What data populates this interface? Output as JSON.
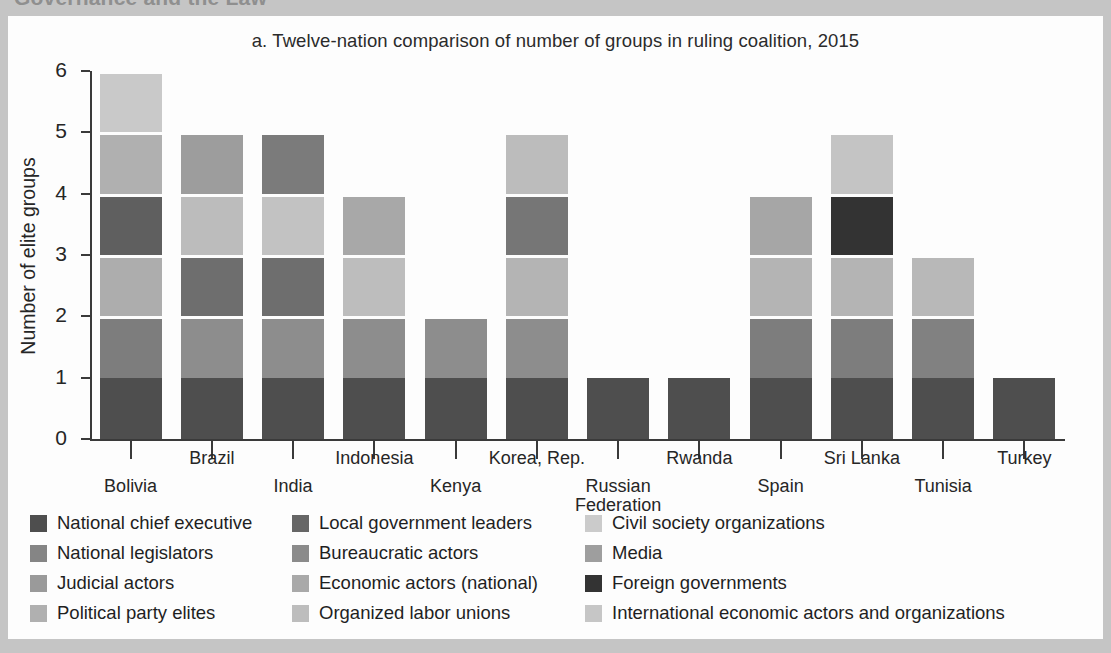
{
  "page": {
    "cut_off_heading": "Governance and the Law",
    "background_color": "#c5c5c5",
    "figure_background": "#fdfdfd"
  },
  "chart_data": {
    "type": "bar",
    "stacked": true,
    "title": "a. Twelve-nation comparison of number of groups in ruling coalition, 2015",
    "xlabel": "",
    "ylabel": "Number of elite groups",
    "ylim": [
      0,
      6
    ],
    "yticks": [
      0,
      1,
      2,
      3,
      4,
      5,
      6
    ],
    "ytick_labels": [
      "0",
      "1",
      "2",
      "3",
      "4",
      "5",
      "6"
    ],
    "grid": false,
    "legend_position": "bottom",
    "categories": [
      "Bolivia",
      "Brazil",
      "India",
      "Indonesia",
      "Kenya",
      "Korea, Rep.",
      "Russian\nFederation",
      "Rwanda",
      "Spain",
      "Sri Lanka",
      "Tunisia",
      "Turkey"
    ],
    "category_labels": [
      "Bolivia",
      "Brazil",
      "India",
      "Indonesia",
      "Kenya",
      "Korea, Rep.",
      "Russian Federation",
      "Rwanda",
      "Spain",
      "Sri Lanka",
      "Tunisia",
      "Turkey"
    ],
    "totals": [
      6,
      5,
      5,
      4,
      2,
      5,
      1,
      1,
      4,
      5,
      3,
      1
    ],
    "series": [
      {
        "name": "National chief executive",
        "color": "#4e4e4e",
        "values": [
          1,
          1,
          1,
          1,
          1,
          1,
          1,
          1,
          1,
          1,
          1,
          1
        ]
      },
      {
        "name": "National legislators",
        "color": "#7d7d7d",
        "values": [
          1,
          1,
          1,
          1,
          1,
          1,
          0,
          0,
          1,
          1,
          1,
          0
        ]
      },
      {
        "name": "Judicial actors",
        "color": "#939393",
        "values": [
          0,
          0,
          0,
          0,
          0,
          0,
          0,
          0,
          0,
          0,
          0,
          0
        ]
      },
      {
        "name": "Political party elites",
        "color": "#adadad",
        "values": [
          1,
          0,
          0,
          0,
          0,
          1,
          0,
          0,
          1,
          1,
          1,
          0
        ]
      },
      {
        "name": "Local government leaders",
        "color": "#6b6b6b",
        "values": [
          1,
          1,
          1,
          1,
          0,
          1,
          0,
          0,
          0,
          0,
          0,
          0
        ]
      },
      {
        "name": "Bureaucratic actors",
        "color": "#8a8a8a",
        "values": [
          0,
          0,
          0,
          0,
          0,
          0,
          0,
          0,
          0,
          0,
          0,
          0
        ]
      },
      {
        "name": "Economic actors (national)",
        "color": "#a8a8a8",
        "values": [
          0,
          1,
          0,
          1,
          0,
          0,
          0,
          0,
          1,
          0,
          0,
          0
        ]
      },
      {
        "name": "Organized labor unions",
        "color": "#b8b8b8",
        "values": [
          0,
          0,
          0,
          0,
          0,
          0,
          0,
          0,
          0,
          0,
          0,
          0
        ]
      },
      {
        "name": "Civil society organizations",
        "color": "#c9c9c9",
        "values": [
          1,
          0,
          0,
          0,
          0,
          0,
          0,
          0,
          0,
          1,
          0,
          0
        ]
      },
      {
        "name": "Media",
        "color": "#9d9d9d",
        "values": [
          0,
          1,
          1,
          0,
          0,
          0,
          0,
          0,
          0,
          0,
          0,
          0
        ]
      },
      {
        "name": "Foreign governments",
        "color": "#333333",
        "values": [
          0,
          0,
          0,
          0,
          0,
          0,
          0,
          0,
          0,
          1,
          0,
          0
        ]
      },
      {
        "name": "International economic actors and organizations",
        "color": "#c2c2c2",
        "values": [
          0,
          0,
          1,
          0,
          0,
          1,
          0,
          0,
          0,
          0,
          0,
          0
        ]
      }
    ],
    "stacks": [
      {
        "category": "Bolivia",
        "segments": [
          {
            "label": "National chief executive",
            "color": "#4e4e4e",
            "value": 1
          },
          {
            "label": "National legislators",
            "color": "#7d7d7d",
            "value": 1
          },
          {
            "label": "Political party elites",
            "color": "#adadad",
            "value": 1
          },
          {
            "label": "Local government leaders",
            "color": "#5f5f5f",
            "value": 1
          },
          {
            "label": "Media",
            "color": "#b0b0b0",
            "value": 1
          },
          {
            "label": "Civil society organizations",
            "color": "#c9c9c9",
            "value": 1
          }
        ]
      },
      {
        "category": "Brazil",
        "segments": [
          {
            "label": "National chief executive",
            "color": "#4e4e4e",
            "value": 1
          },
          {
            "label": "National legislators",
            "color": "#8d8d8d",
            "value": 1
          },
          {
            "label": "Local government leaders",
            "color": "#6e6e6e",
            "value": 1
          },
          {
            "label": "Economic actors (national)",
            "color": "#bcbcbc",
            "value": 1
          },
          {
            "label": "Media",
            "color": "#9d9d9d",
            "value": 1
          }
        ]
      },
      {
        "category": "India",
        "segments": [
          {
            "label": "National chief executive",
            "color": "#4e4e4e",
            "value": 1
          },
          {
            "label": "National legislators",
            "color": "#8d8d8d",
            "value": 1
          },
          {
            "label": "Local government leaders",
            "color": "#6e6e6e",
            "value": 1
          },
          {
            "label": "International economic actors and organizations",
            "color": "#c2c2c2",
            "value": 1
          },
          {
            "label": "Media",
            "color": "#7b7b7b",
            "value": 1
          }
        ]
      },
      {
        "category": "Indonesia",
        "segments": [
          {
            "label": "National chief executive",
            "color": "#4e4e4e",
            "value": 1
          },
          {
            "label": "National legislators",
            "color": "#8d8d8d",
            "value": 1
          },
          {
            "label": "Economic actors (national)",
            "color": "#bdbdbd",
            "value": 1
          },
          {
            "label": "Local government leaders",
            "color": "#a8a8a8",
            "value": 1
          }
        ]
      },
      {
        "category": "Kenya",
        "segments": [
          {
            "label": "National chief executive",
            "color": "#4e4e4e",
            "value": 1
          },
          {
            "label": "National legislators",
            "color": "#8d8d8d",
            "value": 1
          }
        ]
      },
      {
        "category": "Korea, Rep.",
        "segments": [
          {
            "label": "National chief executive",
            "color": "#4e4e4e",
            "value": 1
          },
          {
            "label": "National legislators",
            "color": "#8d8d8d",
            "value": 1
          },
          {
            "label": "Political party elites",
            "color": "#b4b4b4",
            "value": 1
          },
          {
            "label": "Local government leaders",
            "color": "#767676",
            "value": 1
          },
          {
            "label": "International economic actors and organizations",
            "color": "#bcbcbc",
            "value": 1
          }
        ]
      },
      {
        "category": "Russian Federation",
        "segments": [
          {
            "label": "National chief executive",
            "color": "#4e4e4e",
            "value": 1
          }
        ]
      },
      {
        "category": "Rwanda",
        "segments": [
          {
            "label": "National chief executive",
            "color": "#4e4e4e",
            "value": 1
          }
        ]
      },
      {
        "category": "Spain",
        "segments": [
          {
            "label": "National chief executive",
            "color": "#4e4e4e",
            "value": 1
          },
          {
            "label": "National legislators",
            "color": "#7d7d7d",
            "value": 1
          },
          {
            "label": "Economic actors (national)",
            "color": "#b4b4b4",
            "value": 1
          },
          {
            "label": "Political party elites",
            "color": "#a6a6a6",
            "value": 1
          }
        ]
      },
      {
        "category": "Sri Lanka",
        "segments": [
          {
            "label": "National chief executive",
            "color": "#4e4e4e",
            "value": 1
          },
          {
            "label": "National legislators",
            "color": "#7d7d7d",
            "value": 1
          },
          {
            "label": "Political party elites",
            "color": "#b4b4b4",
            "value": 1
          },
          {
            "label": "Foreign governments",
            "color": "#333333",
            "value": 1
          },
          {
            "label": "Civil society organizations",
            "color": "#c4c4c4",
            "value": 1
          }
        ]
      },
      {
        "category": "Tunisia",
        "segments": [
          {
            "label": "National chief executive",
            "color": "#4e4e4e",
            "value": 1
          },
          {
            "label": "National legislators",
            "color": "#818181",
            "value": 1
          },
          {
            "label": "Political party elites",
            "color": "#b8b8b8",
            "value": 1
          }
        ]
      },
      {
        "category": "Turkey",
        "segments": [
          {
            "label": "National chief executive",
            "color": "#4e4e4e",
            "value": 1
          }
        ]
      }
    ],
    "legend": {
      "columns": [
        [
          {
            "label": "National chief executive",
            "color": "#4e4e4e"
          },
          {
            "label": "National legislators",
            "color": "#858585"
          },
          {
            "label": "Judicial actors",
            "color": "#9a9a9a"
          },
          {
            "label": "Political party elites",
            "color": "#b0b0b0"
          }
        ],
        [
          {
            "label": "Local government leaders",
            "color": "#666666"
          },
          {
            "label": "Bureaucratic actors",
            "color": "#8b8b8b"
          },
          {
            "label": "Economic actors (national)",
            "color": "#a9a9a9"
          },
          {
            "label": "Organized labor unions",
            "color": "#bdbdbd"
          }
        ],
        [
          {
            "label": "Civil society organizations",
            "color": "#cbcbcb"
          },
          {
            "label": "Media",
            "color": "#9e9e9e"
          },
          {
            "label": "Foreign governments",
            "color": "#333333"
          },
          {
            "label": "International economic actors and organizations",
            "color": "#c6c6c6"
          }
        ]
      ]
    }
  }
}
